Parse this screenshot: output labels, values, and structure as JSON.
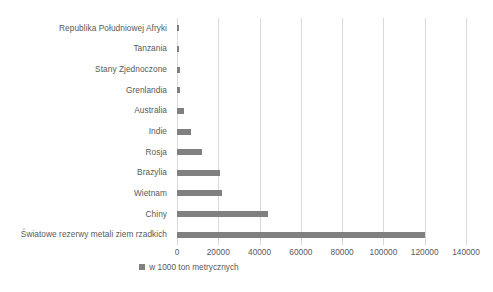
{
  "chart_data": {
    "type": "bar",
    "orientation": "horizontal",
    "title": "",
    "xlabel": "",
    "ylabel": "",
    "xlim": [
      0,
      140000
    ],
    "xticks": [
      0,
      20000,
      40000,
      60000,
      80000,
      100000,
      120000,
      140000
    ],
    "xticklabels": [
      "0",
      "20000",
      "40000",
      "60000",
      "80000",
      "100000",
      "120000",
      "140000"
    ],
    "grid": true,
    "legend_position": "bottom",
    "series_name": "w 1000 ton metrycznych",
    "bar_color": "#808080",
    "gridline_color": "#d9d9d9",
    "text_color": "#595959",
    "categories": [
      "Republika Południowej Afryki",
      "Tanzania",
      "Stany Zjednoczone",
      "Grenlandia",
      "Australia",
      "Indie",
      "Rosja",
      "Brazylia",
      "Wietnam",
      "Chiny",
      "Światowe rezerwy metali ziem rzadkich"
    ],
    "values": [
      790,
      890,
      1400,
      1500,
      3400,
      6900,
      12000,
      21000,
      22000,
      44000,
      120000
    ],
    "series": [
      {
        "name": "w 1000 ton metrycznych",
        "values": [
          790,
          890,
          1400,
          1500,
          3400,
          6900,
          12000,
          21000,
          22000,
          44000,
          120000
        ]
      }
    ]
  },
  "legend": {
    "marker": "square-marker",
    "label": "w 1000 ton metrycznych"
  }
}
